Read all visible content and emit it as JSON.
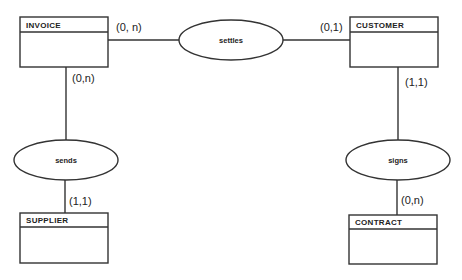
{
  "diagram": {
    "type": "entity-relationship",
    "entities": [
      {
        "id": "invoice",
        "name": "INVOICE"
      },
      {
        "id": "customer",
        "name": "CUSTOMER"
      },
      {
        "id": "supplier",
        "name": "SUPPLIER"
      },
      {
        "id": "contract",
        "name": "CONTRACT"
      }
    ],
    "relationships": [
      {
        "id": "settles",
        "name": "settles",
        "from": "invoice",
        "to": "customer",
        "from_card": "(0, n)",
        "to_card": "(0,1)"
      },
      {
        "id": "sends",
        "name": "sends",
        "from": "invoice",
        "to": "supplier",
        "from_card": "(0,n)",
        "to_card": "(1,1)"
      },
      {
        "id": "signs",
        "name": "signs",
        "from": "customer",
        "to": "contract",
        "from_card": "(1,1)",
        "to_card": "(0,n)"
      }
    ]
  },
  "colors": {
    "stroke": "#333333",
    "text": "#222222",
    "background": "#ffffff"
  }
}
